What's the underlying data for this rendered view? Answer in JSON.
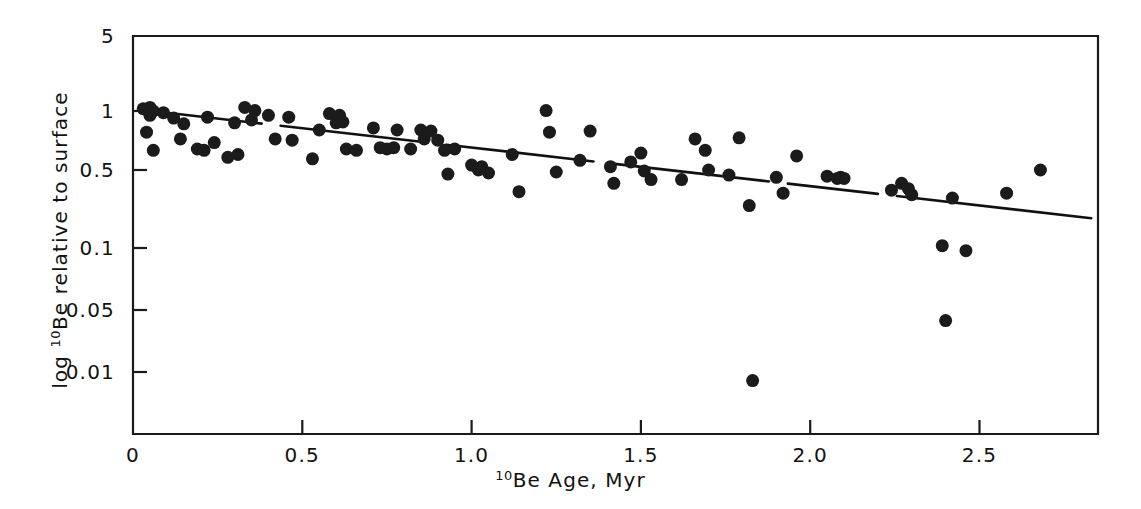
{
  "chart_data": {
    "type": "scatter",
    "title": "",
    "xlabel": "10Be Age, Myr",
    "ylabel": "log 10Be relative to surface",
    "xlabel_sup": "10",
    "xlabel_rest": "Be Age, Myr",
    "ylabel_prefix": "log ",
    "ylabel_sup": "10",
    "ylabel_rest": "Be relative to surface",
    "xlim": [
      0,
      2.85
    ],
    "ylim_log": [
      0.006,
      5
    ],
    "yscale": "log",
    "xscale": "linear",
    "grid": false,
    "legend": null,
    "xticks": [
      0,
      0.5,
      1.0,
      1.5,
      2.0,
      2.5
    ],
    "xticklabels": [
      "0",
      "0.5",
      "1.0",
      "1.5",
      "2.0",
      "2.5"
    ],
    "yticks": [
      5,
      1,
      0.5,
      0.1,
      0.05,
      0.01
    ],
    "yticklabels": [
      "5",
      "1",
      "0.5",
      "0.1",
      "0.05",
      "0.01"
    ],
    "marker": "filled-circle",
    "marker_color": "#1b1b1b",
    "marker_size_px": 13,
    "fit_line": {
      "style": "solid-with-gaps",
      "x_start": 0.03,
      "y_start": 1.02,
      "x_end": 2.83,
      "y_end": 0.185,
      "description": "decreasing log-linear regression line"
    },
    "points": [
      [
        0.03,
        1.05
      ],
      [
        0.05,
        1.08
      ],
      [
        0.06,
        1.0
      ],
      [
        0.05,
        0.95
      ],
      [
        0.04,
        0.78
      ],
      [
        0.06,
        0.63
      ],
      [
        0.09,
        0.98
      ],
      [
        0.12,
        0.92
      ],
      [
        0.15,
        0.86
      ],
      [
        0.14,
        0.72
      ],
      [
        0.19,
        0.64
      ],
      [
        0.21,
        0.63
      ],
      [
        0.22,
        0.93
      ],
      [
        0.24,
        0.69
      ],
      [
        0.28,
        0.58
      ],
      [
        0.31,
        0.6
      ],
      [
        0.3,
        0.87
      ],
      [
        0.33,
        1.08
      ],
      [
        0.35,
        0.9
      ],
      [
        0.36,
        1.01
      ],
      [
        0.4,
        0.95
      ],
      [
        0.42,
        0.72
      ],
      [
        0.46,
        0.93
      ],
      [
        0.47,
        0.71
      ],
      [
        0.53,
        0.57
      ],
      [
        0.55,
        0.8
      ],
      [
        0.58,
        0.97
      ],
      [
        0.6,
        0.87
      ],
      [
        0.61,
        0.95
      ],
      [
        0.62,
        0.88
      ],
      [
        0.63,
        0.64
      ],
      [
        0.66,
        0.63
      ],
      [
        0.71,
        0.82
      ],
      [
        0.73,
        0.65
      ],
      [
        0.75,
        0.64
      ],
      [
        0.77,
        0.65
      ],
      [
        0.78,
        0.8
      ],
      [
        0.82,
        0.64
      ],
      [
        0.85,
        0.8
      ],
      [
        0.86,
        0.72
      ],
      [
        0.88,
        0.79
      ],
      [
        0.9,
        0.71
      ],
      [
        0.92,
        0.63
      ],
      [
        0.93,
        0.46
      ],
      [
        0.95,
        0.64
      ],
      [
        1.0,
        0.53
      ],
      [
        1.02,
        0.5
      ],
      [
        1.03,
        0.52
      ],
      [
        1.05,
        0.47
      ],
      [
        1.12,
        0.6
      ],
      [
        1.14,
        0.32
      ],
      [
        1.22,
        1.01
      ],
      [
        1.23,
        0.78
      ],
      [
        1.25,
        0.48
      ],
      [
        1.32,
        0.56
      ],
      [
        1.35,
        0.79
      ],
      [
        1.41,
        0.52
      ],
      [
        1.42,
        0.38
      ],
      [
        1.47,
        0.55
      ],
      [
        1.5,
        0.61
      ],
      [
        1.51,
        0.49
      ],
      [
        1.53,
        0.41
      ],
      [
        1.62,
        0.41
      ],
      [
        1.66,
        0.72
      ],
      [
        1.69,
        0.63
      ],
      [
        1.7,
        0.5
      ],
      [
        1.76,
        0.45
      ],
      [
        1.79,
        0.73
      ],
      [
        1.82,
        0.24
      ],
      [
        1.83,
        0.008
      ],
      [
        1.9,
        0.43
      ],
      [
        1.92,
        0.31
      ],
      [
        1.96,
        0.59
      ],
      [
        2.05,
        0.44
      ],
      [
        2.08,
        0.42
      ],
      [
        2.09,
        0.43
      ],
      [
        2.1,
        0.42
      ],
      [
        2.24,
        0.33
      ],
      [
        2.27,
        0.38
      ],
      [
        2.29,
        0.34
      ],
      [
        2.3,
        0.3
      ],
      [
        2.39,
        0.105
      ],
      [
        2.4,
        0.038
      ],
      [
        2.42,
        0.28
      ],
      [
        2.46,
        0.097
      ],
      [
        2.58,
        0.31
      ],
      [
        2.68,
        0.5
      ]
    ]
  },
  "axes": {
    "frame_color": "#1a1a1a",
    "background": "#ffffff"
  }
}
